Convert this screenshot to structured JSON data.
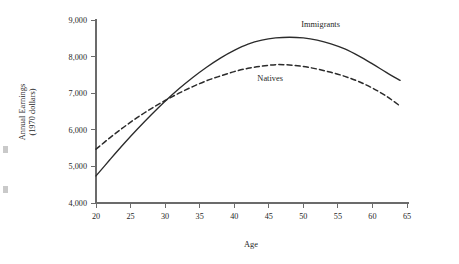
{
  "chart_data": {
    "type": "line",
    "title": "",
    "xlabel": "Age",
    "ylabel_line1": "Annual Earnings",
    "ylabel_line2": "(1970 dollars)",
    "xlim": [
      20,
      65
    ],
    "ylim": [
      4000,
      9000
    ],
    "xticks": [
      20,
      25,
      30,
      35,
      40,
      45,
      50,
      55,
      60,
      65
    ],
    "xtick_labels": [
      "20",
      "25",
      "30",
      "35",
      "40",
      "45",
      "50",
      "55",
      "60",
      "65"
    ],
    "yticks": [
      4000,
      5000,
      6000,
      7000,
      8000,
      9000
    ],
    "ytick_labels": [
      "4,000",
      "5,000",
      "6,000",
      "7,000",
      "8,000",
      "9,000"
    ],
    "grid": false,
    "legend_position": "inline-annotation",
    "x": [
      20,
      22,
      24,
      26,
      28,
      30,
      32,
      34,
      36,
      38,
      40,
      42,
      44,
      46,
      48,
      50,
      52,
      54,
      56,
      58,
      60,
      62,
      64
    ],
    "series": [
      {
        "name": "Immigrants",
        "style": "solid",
        "color": "#2b2b2b",
        "label_x": 52.5,
        "label_y": 8810,
        "values": [
          4740,
          5180,
          5610,
          6020,
          6410,
          6780,
          7120,
          7430,
          7710,
          7960,
          8170,
          8340,
          8450,
          8510,
          8530,
          8510,
          8450,
          8350,
          8210,
          8020,
          7800,
          7570,
          7350
        ]
      },
      {
        "name": "Natives",
        "style": "dashed",
        "color": "#2b2b2b",
        "label_x": 45.2,
        "label_y": 7330,
        "values": [
          5470,
          5780,
          6070,
          6340,
          6580,
          6800,
          7000,
          7180,
          7340,
          7470,
          7590,
          7680,
          7740,
          7780,
          7770,
          7730,
          7660,
          7570,
          7460,
          7320,
          7140,
          6920,
          6650
        ]
      }
    ]
  }
}
